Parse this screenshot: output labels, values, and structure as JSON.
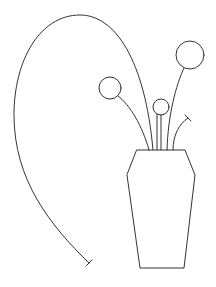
{
  "drawing": {
    "subject": "vase with flowers line drawing",
    "stroke_color": "#333333",
    "background": "#ffffff",
    "vase": {
      "points": "137,150 185,150 195,175 184,268 140,268 127,175"
    },
    "flowers": [
      {
        "name": "large-flower",
        "cx": 190,
        "cy": 55,
        "r": 14,
        "stem": "M167,150 C168,115 176,85 184,68"
      },
      {
        "name": "left-flower",
        "cx": 110,
        "cy": 88,
        "r": 11,
        "stem": "M149,150 C142,125 130,105 118,96"
      },
      {
        "name": "small-flower",
        "cx": 161,
        "cy": 107,
        "r": 8,
        "stem": "M161,150 L161,115"
      }
    ],
    "bud_stem": {
      "path": "M173,150 C173,135 179,124 188,118",
      "tick": "M185,115 L191,121"
    },
    "long_stem": {
      "path": "M153,150 C145,60 115,15 80,15 C40,15 14,60 14,115 C14,180 50,225 89,263",
      "tick": "M86,266 L92,260"
    }
  }
}
